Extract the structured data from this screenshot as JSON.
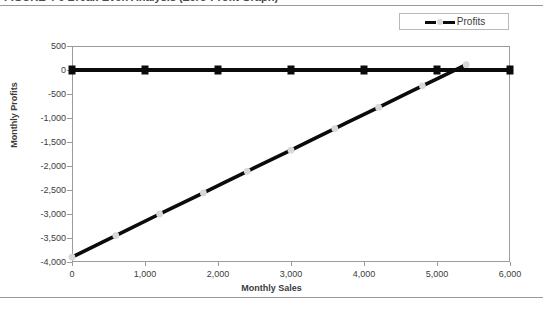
{
  "header": {
    "title_clipped": "FIGURE 4-9  Break-Even Analysis (Zero-Profit Graph)"
  },
  "legend": {
    "position": "top-right",
    "entries": [
      {
        "label": "Profits",
        "marker": "dashed-line-with-circle",
        "color": "#0b0b0b"
      }
    ]
  },
  "axis_titles": {
    "x": "Monthly Sales",
    "y": "Monthly Profits"
  },
  "chart_data": {
    "type": "line",
    "title": "Break-Even Analysis (Zero-Profit Graph)",
    "xlabel": "Monthly Sales",
    "ylabel": "Monthly Profits",
    "xlim": [
      0,
      6000
    ],
    "ylim": [
      -4000,
      500
    ],
    "xticks": [
      0,
      1000,
      2000,
      3000,
      4000,
      5000,
      6000
    ],
    "xtick_labels": [
      "0",
      "1,000",
      "2,000",
      "3,000",
      "4,000",
      "5,000",
      "6,000"
    ],
    "yticks": [
      500,
      0,
      -500,
      -1000,
      -1500,
      -2000,
      -2500,
      -3000,
      -3500,
      -4000
    ],
    "ytick_labels": [
      "500",
      "0",
      "-500",
      "-1,000",
      "-1,500",
      "-2,000",
      "-2,500",
      "-3,000",
      "-3,500",
      "-4,000"
    ],
    "grid": false,
    "legend": "top-right",
    "series": [
      {
        "name": "Zero Line",
        "style": "solid",
        "marker": "square",
        "color": "#0b0b0b",
        "x": [
          0,
          1000,
          2000,
          3000,
          4000,
          5000,
          6000
        ],
        "values": [
          0,
          0,
          0,
          0,
          0,
          0,
          0
        ]
      },
      {
        "name": "Profits",
        "style": "dashed",
        "marker": "circle",
        "color": "#0b0b0b",
        "marker_color": "#d8d8d8",
        "x": [
          0,
          600,
          1200,
          1800,
          2400,
          3000,
          3600,
          4200,
          4800,
          5400
        ],
        "values": [
          -3900,
          -3450,
          -3000,
          -2560,
          -2110,
          -1670,
          -1220,
          -780,
          -330,
          110
        ]
      }
    ],
    "break_even_x": 5150
  }
}
